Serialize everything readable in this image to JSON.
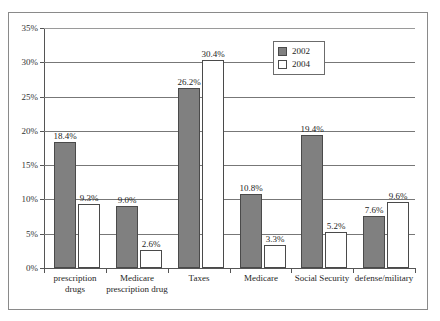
{
  "chart_data": {
    "type": "bar",
    "title": "",
    "subtitle": "",
    "xlabel": "",
    "ylabel": "",
    "ylim": [
      0,
      35
    ],
    "y_tick_labels": [
      "0%",
      "5%",
      "10%",
      "15%",
      "20%",
      "25%",
      "30%",
      "35%"
    ],
    "y_tick_values": [
      0,
      5,
      10,
      15,
      20,
      25,
      30,
      35
    ],
    "grid": true,
    "legend_position": "top-right",
    "categories": [
      "prescription drugs",
      "Medicare prescription drug",
      "Taxes",
      "Medicare",
      "Social Security",
      "defense/military"
    ],
    "series": [
      {
        "name": "2002",
        "color": "#808080",
        "values": [
          18.4,
          9.0,
          26.2,
          10.8,
          19.4,
          7.6
        ],
        "labels": [
          "18.4%",
          "9.0%",
          "26.2%",
          "10.8%",
          "19.4%",
          "7.6%"
        ]
      },
      {
        "name": "2004",
        "color": "#ffffff",
        "values": [
          9.3,
          2.6,
          30.4,
          3.3,
          5.2,
          9.6
        ],
        "labels": [
          "9.3%",
          "2.6%",
          "30.4%",
          "3.3%",
          "5.2%",
          "9.6%"
        ]
      }
    ]
  },
  "legend": {
    "entries": [
      {
        "label": "2002",
        "swatch": "filled-gray-square"
      },
      {
        "label": "2004",
        "swatch": "empty-white-square"
      }
    ]
  }
}
